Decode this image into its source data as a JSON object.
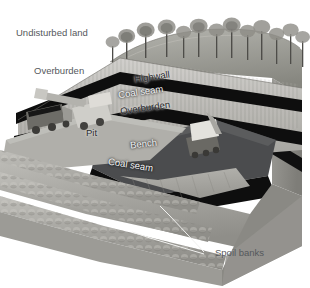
{
  "figure": {
    "kind": "block-diagram",
    "background_color": "#ffffff",
    "palette": {
      "sky": "#ffffff",
      "grass_top": "#9a9a94",
      "overburden_rock": "#b9b8b4",
      "highwall_rock": "#c2c1bd",
      "coal": "#111111",
      "bench": "#4f5052",
      "spoil": "#a8a7a2",
      "block_side": "#8e8d88",
      "label_dark": "#2a2b2d",
      "label_light": "#f2f3f4",
      "label_outside": "#55585c",
      "leader_line": "#f0f0ee"
    }
  },
  "labels": {
    "undisturbed_land": "Undisturbed land",
    "overburden_outer": "Overburden",
    "highwall": "Highwall",
    "coal_seam_upper": "Coal seam",
    "overburden_inner": "Overburden",
    "pit": "Pit",
    "bench": "Bench",
    "coal_seam_lower": "Coal seam",
    "spoil_banks": "Spoil banks"
  },
  "features": {
    "tree_count": 13,
    "coal_seam_count": 2,
    "spoil_bank_ridge_count": 3,
    "leader_line_count": 2,
    "vehicles": [
      {
        "name": "haul-truck",
        "load": "coal"
      },
      {
        "name": "front-loader"
      },
      {
        "name": "tracked-shovel"
      }
    ]
  }
}
